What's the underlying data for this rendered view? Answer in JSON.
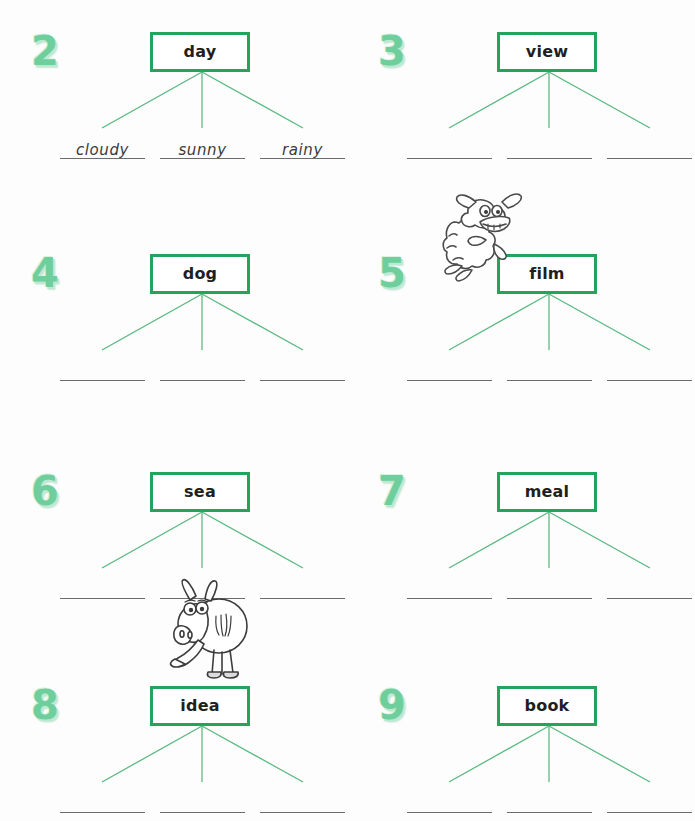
{
  "page": {
    "background_color": "#fdfdfd",
    "accent_green": "#24a35c",
    "branch_green": "#57b87e",
    "number_green": "#6ecf9c",
    "line_color": "#6b6b6b"
  },
  "items": [
    {
      "number": "2",
      "word": "day",
      "answers": [
        "cloudy",
        "sunny",
        "rainy"
      ],
      "illustration": ""
    },
    {
      "number": "3",
      "word": "view",
      "answers": [
        "",
        "",
        ""
      ],
      "illustration": ""
    },
    {
      "number": "4",
      "word": "dog",
      "answers": [
        "",
        "",
        ""
      ],
      "illustration": ""
    },
    {
      "number": "5",
      "word": "film",
      "answers": [
        "",
        "",
        ""
      ],
      "illustration": "sheep-cartoon"
    },
    {
      "number": "6",
      "word": "sea",
      "answers": [
        "",
        "",
        ""
      ],
      "illustration": ""
    },
    {
      "number": "7",
      "word": "meal",
      "answers": [
        "",
        "",
        ""
      ],
      "illustration": ""
    },
    {
      "number": "8",
      "word": "idea",
      "answers": [
        "",
        "",
        ""
      ],
      "illustration": "donkey-cartoon"
    },
    {
      "number": "9",
      "word": "book",
      "answers": [
        "",
        "",
        ""
      ],
      "illustration": ""
    }
  ],
  "illustrations": [
    {
      "name": "sheep-cartoon",
      "描述": "sheep leaning on box",
      "label": "sheep"
    },
    {
      "name": "donkey-cartoon",
      "描述": "donkey standing on box",
      "label": "donkey"
    }
  ]
}
